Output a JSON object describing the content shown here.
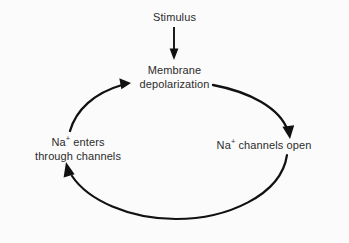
{
  "diagram": {
    "background_color": "#fbfbfb",
    "stroke_color": "#111111",
    "text_color": "#2b2b2b",
    "nodes": [
      {
        "id": "stimulus",
        "label": "Stimulus",
        "lines": [
          "Stimulus"
        ]
      },
      {
        "id": "depolarization",
        "label": "Membrane depolarization",
        "lines": [
          "Membrane",
          "depolarization"
        ]
      },
      {
        "id": "channels_open",
        "label": "Na+ channels open",
        "lines": [
          "Na+ channels open"
        ],
        "prefix": "Na",
        "superscript": "+",
        "suffix": " channels open"
      },
      {
        "id": "na_enters",
        "label": "Na+ enters through channels",
        "lines": [
          "Na+ enters",
          "through channels"
        ],
        "line1_prefix": "Na",
        "line1_superscript": "+",
        "line1_suffix": " enters",
        "line2": "through channels"
      }
    ],
    "arrows": [
      {
        "id": "stimulus-to-depolarization",
        "from": "stimulus",
        "to": "depolarization",
        "shape": "straight-vertical",
        "direction": "down"
      },
      {
        "id": "depolarization-to-channels-open",
        "from": "depolarization",
        "to": "channels_open",
        "shape": "curved-arc",
        "direction": "clockwise-right"
      },
      {
        "id": "channels-open-to-na-enters",
        "from": "channels_open",
        "to": "na_enters",
        "shape": "curved-arc",
        "direction": "clockwise-bottom"
      },
      {
        "id": "na-enters-to-depolarization",
        "from": "na_enters",
        "to": "depolarization",
        "shape": "curved-arc",
        "direction": "clockwise-left"
      }
    ]
  }
}
